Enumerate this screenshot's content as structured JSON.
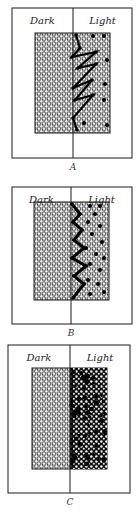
{
  "figure": {
    "background": "#ffffff",
    "ink": "#1a1a1a",
    "panels": [
      {
        "id": "A",
        "caption": "A",
        "left_label": "Dark",
        "right_label": "Light",
        "frame": {
          "x": 12,
          "y": 8,
          "w": 120,
          "h": 150
        },
        "divider_x": 73,
        "inner": {
          "x": 35,
          "y": 33,
          "w": 75,
          "h": 100
        },
        "caption_y": 170,
        "right_density": "sparse",
        "path": [
          [
            76,
            35
          ],
          [
            80,
            48
          ],
          [
            72,
            57
          ],
          [
            96,
            52
          ],
          [
            78,
            68
          ],
          [
            96,
            64
          ],
          [
            73,
            88
          ],
          [
            92,
            80
          ],
          [
            75,
            100
          ],
          [
            93,
            95
          ],
          [
            73,
            118
          ],
          [
            77,
            130
          ]
        ],
        "dots": [
          [
            93,
            36
          ],
          [
            104,
            36
          ],
          [
            107,
            60
          ],
          [
            105,
            84
          ],
          [
            104,
            100
          ],
          [
            84,
            123
          ],
          [
            107,
            125
          ]
        ]
      },
      {
        "id": "B",
        "caption": "B",
        "left_label": "Dark",
        "right_label": "Light",
        "frame": {
          "x": 12,
          "y": 187,
          "w": 120,
          "h": 137
        },
        "divider_x": 71,
        "inner": {
          "x": 34,
          "y": 202,
          "w": 75,
          "h": 98
        },
        "caption_y": 336,
        "right_density": "medium",
        "path": [
          [
            72,
            204
          ],
          [
            80,
            214
          ],
          [
            73,
            222
          ],
          [
            82,
            230
          ],
          [
            74,
            240
          ],
          [
            84,
            248
          ],
          [
            72,
            258
          ],
          [
            86,
            266
          ],
          [
            74,
            276
          ],
          [
            84,
            284
          ],
          [
            73,
            298
          ]
        ],
        "dots": [
          [
            90,
            206
          ],
          [
            100,
            206
          ],
          [
            95,
            214
          ],
          [
            88,
            222
          ],
          [
            100,
            226
          ],
          [
            92,
            234
          ],
          [
            102,
            242
          ],
          [
            86,
            248
          ],
          [
            96,
            254
          ],
          [
            104,
            258
          ],
          [
            90,
            264
          ],
          [
            100,
            270
          ],
          [
            88,
            280
          ],
          [
            98,
            284
          ],
          [
            104,
            292
          ],
          [
            90,
            294
          ]
        ]
      },
      {
        "id": "C",
        "caption": "C",
        "left_label": "Dark",
        "right_label": "Light",
        "frame": {
          "x": 8,
          "y": 345,
          "w": 122,
          "h": 148
        },
        "divider_x": 70,
        "inner": {
          "x": 32,
          "y": 368,
          "w": 75,
          "h": 101
        },
        "caption_y": 505,
        "right_density": "dense",
        "path": [],
        "dots": []
      }
    ]
  }
}
